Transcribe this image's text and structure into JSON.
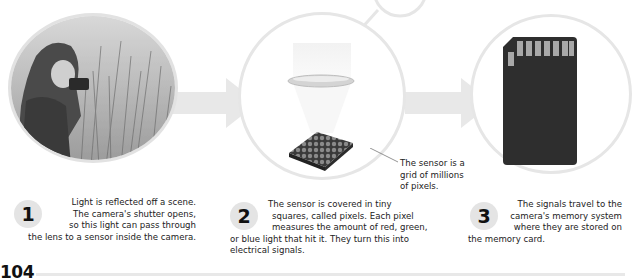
{
  "steps": [
    {
      "number": "1",
      "image": "photographer-in-grass-photo",
      "lines": [
        "Light is reflected off a scene.",
        "The camera's shutter opens,",
        "so this light can pass through",
        "the lens to a sensor inside the camera."
      ]
    },
    {
      "number": "2",
      "image": "lens-and-sensor-illustration",
      "callout": [
        "The sensor is a",
        "grid of millions",
        "of pixels."
      ],
      "lines": [
        "The sensor is covered in tiny",
        "squares, called pixels. Each pixel",
        "measures the amount of red, green,",
        "or blue light that hit it. They turn this into",
        "electrical signals."
      ]
    },
    {
      "number": "3",
      "image": "memory-card-illustration",
      "lines": [
        "The signals travel to the",
        "camera's memory system",
        "where they are stored on",
        "the memory card."
      ]
    }
  ],
  "page": {
    "number": "104"
  },
  "colors": {
    "circle_border": "#e6e6e6",
    "arrow": "#e8e8e8",
    "badge": "#e4e4e4",
    "card": "#2e2e2e"
  }
}
